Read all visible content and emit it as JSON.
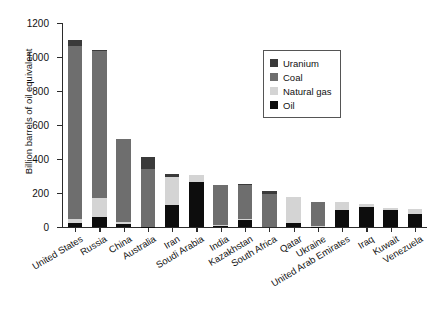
{
  "chart_data": {
    "type": "bar",
    "subtype": "stacked-bar",
    "title": "",
    "xlabel": "",
    "ylabel": "Billion barrels of oil equivalent",
    "ylim": [
      0,
      1200
    ],
    "yticks": [
      0,
      200,
      400,
      600,
      800,
      1000,
      1200
    ],
    "grid": false,
    "legend_position": "top-right",
    "stack_order_bottom_to_top": [
      "Oil",
      "Natural gas",
      "Coal",
      "Uranium"
    ],
    "categories": [
      "United States",
      "Russia",
      "China",
      "Australia",
      "Iran",
      "Soudi Arabia",
      "India",
      "Kazakhstan",
      "South Africa",
      "Qatar",
      "Ukraine",
      "United Arab Emirates",
      "Iraq",
      "Kuwait",
      "Venezuela"
    ],
    "series": [
      {
        "name": "Oil",
        "color": "#0d0d0d",
        "values": [
          22,
          60,
          18,
          2,
          130,
          262,
          8,
          40,
          0,
          22,
          2,
          98,
          115,
          102,
          77
        ]
      },
      {
        "name": "Natural gas",
        "color": "#d4d4d4",
        "values": [
          27,
          112,
          12,
          0,
          165,
          45,
          6,
          10,
          0,
          155,
          6,
          47,
          19,
          11,
          27
        ]
      },
      {
        "name": "Coal",
        "color": "#6e6e6e",
        "values": [
          1018,
          862,
          490,
          340,
          0,
          0,
          236,
          198,
          196,
          0,
          140,
          0,
          0,
          0,
          0
        ]
      },
      {
        "name": "Uranium",
        "color": "#3a3a3a",
        "values": [
          33,
          10,
          0,
          68,
          15,
          0,
          0,
          7,
          16,
          0,
          0,
          0,
          0,
          0,
          0
        ]
      }
    ],
    "totals": [
      1100,
      1044,
      520,
      410,
      310,
      307,
      250,
      255,
      212,
      177,
      148,
      145,
      134,
      113,
      104
    ]
  },
  "legend": {
    "items": [
      {
        "label": "Uranium",
        "color": "#3a3a3a"
      },
      {
        "label": "Coal",
        "color": "#6e6e6e"
      },
      {
        "label": "Natural gas",
        "color": "#d4d4d4"
      },
      {
        "label": "Oil",
        "color": "#0d0d0d"
      }
    ]
  }
}
